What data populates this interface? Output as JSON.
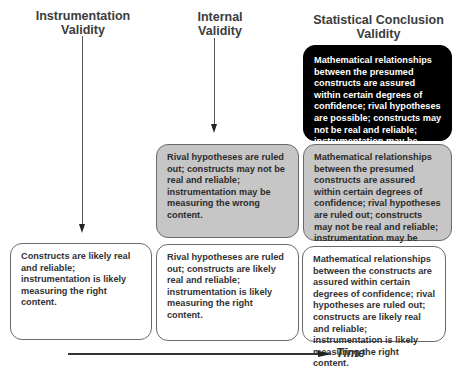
{
  "columns": [
    {
      "heading_line1": "Instrumentation",
      "heading_line2": "Validity",
      "boxes": [
        {
          "style": "white",
          "text": "Constructs are likely real and reliable; instrumentation is likely measuring the right content."
        }
      ]
    },
    {
      "heading_line1": "Internal",
      "heading_line2": "Validity",
      "boxes": [
        {
          "style": "gray",
          "text": "Rival hypotheses are ruled out; constructs may not be real and reliable; instrumentation may be measuring the wrong content."
        },
        {
          "style": "white",
          "text": "Rival hypotheses are ruled out; constructs are likely real and reliable; instrumentation is likely measuring the right content."
        }
      ]
    },
    {
      "heading_line1": "Statistical Conclusion",
      "heading_line2": "Validity",
      "boxes": [
        {
          "style": "black",
          "text": "Mathematical relationships between the presumed constructs are assured within certain degrees of confidence; rival hypotheses are possible; constructs may not be real and reliable; instrumentation may be measuring the wrong content"
        },
        {
          "style": "gray",
          "text": "Mathematical relationships between the presumed constructs are assured within certain degrees of confidence; rival hypotheses are ruled out; constructs may not be real and reliable; instrumentation may be measuring the wrong content."
        },
        {
          "style": "white",
          "text": "Mathematical relationships between the constructs are assured within certain degrees of confidence; rival hypotheses are ruled out; constructs are likely real and reliable; instrumentation is likely measuring the right content."
        }
      ]
    }
  ],
  "axis": {
    "label": "Time"
  },
  "colors": {
    "black_box": "#000000",
    "gray_box": "#c6c6c6",
    "white_box": "#ffffff",
    "border": "#6a6a6a"
  }
}
